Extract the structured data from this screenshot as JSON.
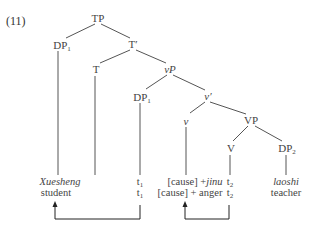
{
  "example_number": "(11)",
  "nodes": {
    "tp": "TP",
    "dp1_spec": "DP",
    "dp1_spec_sub": "1",
    "tbar": "T′",
    "t": "T",
    "vp_small": "vP",
    "dp1_inner": "DP",
    "dp1_inner_sub": "1",
    "vbar_small": "v′",
    "v_small": "v",
    "vp_big": "VP",
    "v_big": "V",
    "dp2": "DP",
    "dp2_sub": "2"
  },
  "leaves": {
    "col1": {
      "gloss_src": "Xuesheng",
      "gloss_en": "student"
    },
    "col3": {
      "trace1": "t",
      "trace1_sub": "1",
      "trace2": "t",
      "trace2_sub": "1"
    },
    "col4": {
      "src_prefix": "[cause] +",
      "src_word": "jinu",
      "en": "[cause] + anger"
    },
    "col5": {
      "trace1": "t",
      "trace1_sub": "2",
      "trace2": "t",
      "trace2_sub": "2"
    },
    "col6": {
      "gloss_src": "laoshi",
      "gloss_en": "teacher"
    }
  },
  "movement_arrows": [
    {
      "from": "t1",
      "to": "Xuesheng"
    },
    {
      "from": "t2",
      "to": "[cause]+jinu"
    }
  ]
}
